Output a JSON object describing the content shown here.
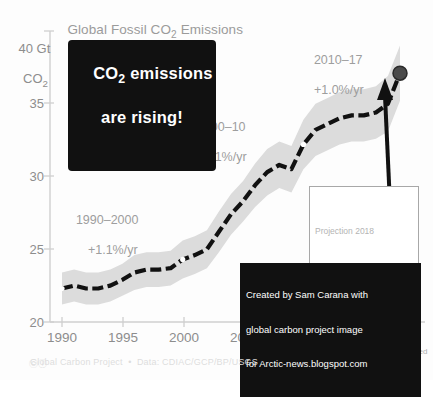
{
  "chart": {
    "title": "Global Fossil CO2 Emissions",
    "title_parts": {
      "pre": "Global Fossil CO",
      "sub": "2",
      "post": " Emissions"
    },
    "y_axis_title_line1": "40 Gt",
    "y_axis_title_line2": "CO2",
    "y_ticks": [
      "35",
      "30",
      "25",
      "20"
    ],
    "x_ticks": [
      "1990",
      "1995",
      "2000",
      "2005",
      "2010",
      "2015"
    ],
    "x_tick_last": "18",
    "projected_label": "projected",
    "footer": "Global Carbon Project  •  Data: CDIAC/GCP/BP/USGS",
    "cc_icon": "cc-by-icon",
    "colors": {
      "line": "#111111",
      "band": "#dcdcdc",
      "axis": "#cccccc",
      "text_gray": "#9b9b9b",
      "callout_bg": "#111111",
      "marker": "#4a4a4a"
    }
  },
  "annotations": {
    "callout": {
      "line1": "CO2 emissions",
      "line1_pre": "CO",
      "line1_sub": "2",
      "line1_post": " emissions",
      "line2": "are rising!"
    },
    "rate_1990": {
      "period": "1990–2000",
      "rate": "+1.1%/yr"
    },
    "rate_2000": {
      "period": "2000–10",
      "rate": "+3.1%/yr"
    },
    "rate_2010": {
      "period": "2010–17",
      "rate": "+1.0%/yr"
    },
    "projection": {
      "title": "Projection 2018",
      "value_pre": "37.1 Gt CO",
      "value_sub": "2",
      "change": "▲ 2.7% (1.8%–3.7%)"
    },
    "credit": {
      "line1": "Created by Sam Carana with",
      "line2": "global carbon project image",
      "line3": "for Arctic-news.blogspot.com"
    }
  },
  "chart_data": {
    "type": "line",
    "title": "Global Fossil CO2 Emissions",
    "xlabel": "",
    "ylabel": "Gt CO2",
    "xlim": [
      1989.2,
      2018.6
    ],
    "ylim": [
      20,
      40
    ],
    "grid": false,
    "legend": null,
    "x": [
      1990,
      1991,
      1992,
      1993,
      1994,
      1995,
      1996,
      1997,
      1998,
      1999,
      2000,
      2001,
      2002,
      2003,
      2004,
      2005,
      2006,
      2007,
      2008,
      2009,
      2010,
      2011,
      2012,
      2013,
      2014,
      2015,
      2016,
      2017,
      2018
    ],
    "series": [
      {
        "name": "Fossil CO2 emissions",
        "values": [
          22.3,
          22.5,
          22.3,
          22.3,
          22.5,
          22.9,
          23.4,
          23.6,
          23.6,
          23.7,
          24.3,
          24.6,
          25.0,
          26.2,
          27.4,
          28.3,
          29.4,
          30.3,
          30.8,
          30.5,
          32.2,
          33.2,
          33.6,
          34.0,
          34.2,
          34.2,
          34.4,
          35.0,
          37.1
        ]
      }
    ],
    "uncertainty_band": {
      "lower": [
        21.2,
        21.4,
        21.2,
        21.2,
        21.4,
        21.8,
        22.2,
        22.4,
        22.4,
        22.5,
        23.0,
        23.3,
        23.7,
        24.8,
        26.0,
        26.9,
        27.9,
        28.7,
        29.2,
        28.9,
        30.5,
        31.4,
        31.8,
        32.2,
        32.4,
        32.4,
        32.6,
        33.1,
        35.2
      ],
      "upper": [
        23.4,
        23.6,
        23.4,
        23.4,
        23.6,
        24.0,
        24.6,
        24.8,
        24.8,
        24.9,
        25.6,
        25.9,
        26.3,
        27.6,
        28.8,
        29.7,
        30.9,
        31.9,
        32.4,
        32.1,
        33.9,
        35.0,
        35.4,
        35.8,
        36.0,
        36.0,
        36.2,
        36.9,
        39.0
      ]
    },
    "markers": [
      {
        "x": 1990,
        "y": 22.3,
        "style": "white-dot"
      },
      {
        "x": 2000,
        "y": 24.3,
        "style": "white-dot"
      },
      {
        "x": 2010,
        "y": 32.2,
        "style": "white-dot"
      },
      {
        "x": 2018,
        "y": 37.1,
        "style": "filled-dot"
      }
    ],
    "annotations": [
      {
        "text": "1990–2000 +1.1%/yr",
        "x": 1994,
        "y": 26.5
      },
      {
        "text": "2000–10 +3.1%/yr",
        "x": 2002.5,
        "y": 33.0
      },
      {
        "text": "2010–17 +1.0%/yr",
        "x": 2012.5,
        "y": 38.3
      },
      {
        "text": "Projection 2018: 37.1 Gt CO2, ▲ 2.7% (1.8%–3.7%)",
        "x": 2016,
        "y": 26.0
      }
    ]
  }
}
